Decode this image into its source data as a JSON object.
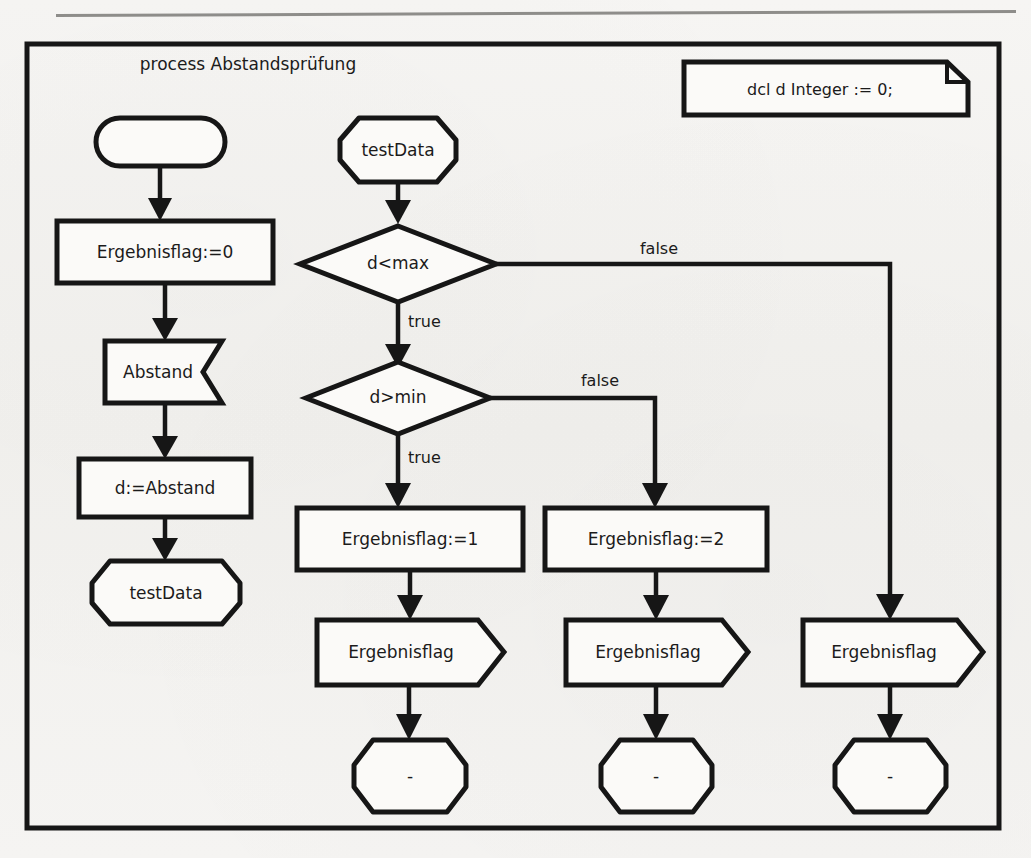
{
  "diagram": {
    "kind": "sdl-process-flowchart",
    "title": "process Abstandsprüfung",
    "declaration": "dcl d Integer := 0;",
    "colors": {
      "ink": "#161616",
      "paper": "#f4f3f1",
      "shape_fill": "#fbfaf8"
    },
    "nodes": {
      "start_state": {
        "label": "",
        "type": "state-start"
      },
      "task_flag_zero": {
        "label": "Ergebnisflag:=0",
        "type": "task"
      },
      "input_abstand": {
        "label": "Abstand",
        "type": "input"
      },
      "task_d_assign": {
        "label": "d:=Abstand",
        "type": "task"
      },
      "state_testdata_left": {
        "label": "testData",
        "type": "state"
      },
      "state_testdata_top": {
        "label": "testData",
        "type": "state"
      },
      "decision_dmax": {
        "label": "d<max",
        "type": "decision"
      },
      "decision_dmin": {
        "label": "d>min",
        "type": "decision"
      },
      "task_flag_one": {
        "label": "Ergebnisflag:=1",
        "type": "task"
      },
      "task_flag_two": {
        "label": "Ergebnisflag:=2",
        "type": "task"
      },
      "output_flag_left": {
        "label": "Ergebnisflag",
        "type": "output"
      },
      "output_flag_mid": {
        "label": "Ergebnisflag",
        "type": "output"
      },
      "output_flag_right": {
        "label": "Ergebnisflag",
        "type": "output"
      },
      "state_dash_left": {
        "label": "-",
        "type": "state"
      },
      "state_dash_mid": {
        "label": "-",
        "type": "state"
      },
      "state_dash_right": {
        "label": "-",
        "type": "state"
      }
    },
    "edge_labels": {
      "dmax_false": "false",
      "dmax_true": "true",
      "dmin_false": "false",
      "dmin_true": "true"
    }
  }
}
